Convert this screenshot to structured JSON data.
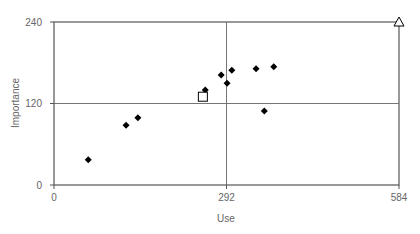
{
  "chart_data": {
    "type": "scatter",
    "title": "",
    "xlabel": "Use",
    "ylabel": "Importance",
    "xlim": [
      0,
      584
    ],
    "ylim": [
      0,
      240
    ],
    "x_ticks": [
      "0",
      "292",
      "584"
    ],
    "y_ticks": [
      "0",
      "120",
      "240"
    ],
    "grid": false,
    "reference_lines": {
      "x": 292,
      "y": 120
    },
    "legend": null,
    "series": [
      {
        "name": "points",
        "marker": "diamond",
        "color": "#000000",
        "points": [
          {
            "x": 58,
            "y": 37
          },
          {
            "x": 122,
            "y": 88
          },
          {
            "x": 142,
            "y": 99
          },
          {
            "x": 256,
            "y": 140
          },
          {
            "x": 283,
            "y": 162
          },
          {
            "x": 293,
            "y": 150
          },
          {
            "x": 301,
            "y": 169
          },
          {
            "x": 342,
            "y": 171
          },
          {
            "x": 356,
            "y": 109
          },
          {
            "x": 372,
            "y": 174
          }
        ]
      },
      {
        "name": "average",
        "marker": "square-open",
        "color": "#000000",
        "points": [
          {
            "x": 252,
            "y": 130
          }
        ]
      },
      {
        "name": "maximum",
        "marker": "triangle-open",
        "color": "#000000",
        "points": [
          {
            "x": 584,
            "y": 240
          }
        ]
      }
    ]
  }
}
